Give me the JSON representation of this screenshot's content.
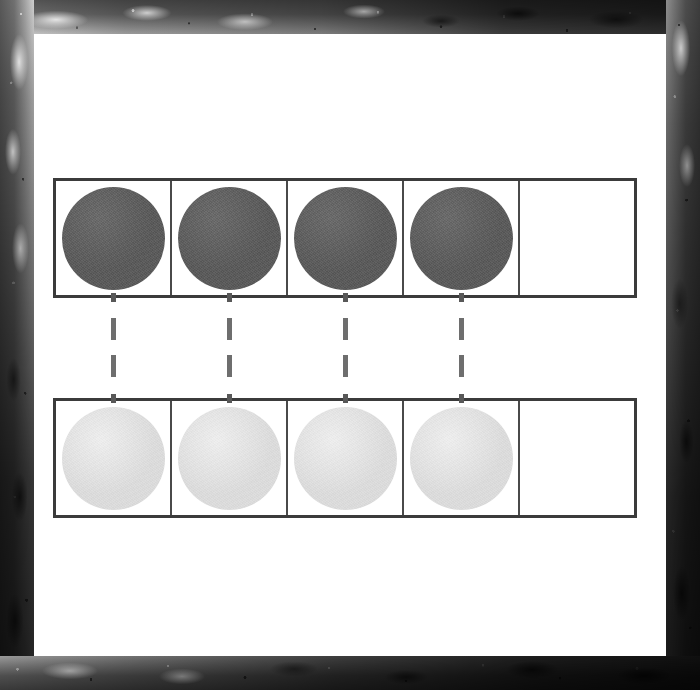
{
  "document": {
    "kind": "math-worksheet-scan",
    "title": "One-to-one correspondence ten-frame",
    "page_background": "#ffffff",
    "border_style": "grunge-photocopy-edge"
  },
  "palette": {
    "frame_stroke": "#3b3b3b",
    "cell_divider": "#4a4a4a",
    "dark_counter": "#5b5b5b",
    "light_counter": "#dedede",
    "connector": "#6e6e6e",
    "paper": "#ffffff",
    "border_dark": "#1a1a1a",
    "border_light": "#cfcfcf"
  },
  "rows": [
    {
      "id": "top-row",
      "name": "Top counter frame",
      "counter_style": "dark",
      "cell_count": 5,
      "filled_count": 4,
      "empty_count": 1,
      "cells": [
        {
          "index": 1,
          "filled": true,
          "counter": "dark"
        },
        {
          "index": 2,
          "filled": true,
          "counter": "dark"
        },
        {
          "index": 3,
          "filled": true,
          "counter": "dark"
        },
        {
          "index": 4,
          "filled": true,
          "counter": "dark"
        },
        {
          "index": 5,
          "filled": false,
          "counter": "none"
        }
      ]
    },
    {
      "id": "bottom-row",
      "name": "Bottom counter frame",
      "counter_style": "light",
      "cell_count": 5,
      "filled_count": 4,
      "empty_count": 1,
      "cells": [
        {
          "index": 1,
          "filled": true,
          "counter": "light"
        },
        {
          "index": 2,
          "filled": true,
          "counter": "light"
        },
        {
          "index": 3,
          "filled": true,
          "counter": "light"
        },
        {
          "index": 4,
          "filled": true,
          "counter": "light"
        },
        {
          "index": 5,
          "filled": false,
          "counter": "none"
        }
      ]
    }
  ],
  "connectors": {
    "name": "matching-dashed-lines",
    "count": 4,
    "style": "dashed-vertical",
    "segments_per_connector": 2,
    "left_positions_px": [
      111,
      227,
      343,
      459
    ]
  },
  "chart_data": {
    "type": "table",
    "categories": [
      "Cell 1",
      "Cell 2",
      "Cell 3",
      "Cell 4",
      "Cell 5"
    ],
    "series": [
      {
        "name": "Top row (dark counters)",
        "values": [
          1,
          1,
          1,
          1,
          0
        ]
      },
      {
        "name": "Bottom row (light counters)",
        "values": [
          1,
          1,
          1,
          1,
          0
        ]
      }
    ],
    "xlabel": "",
    "ylabel": "",
    "annotations": [
      "4 dark counters matched one-to-one with 4 light counters",
      "1 empty cell remains in each row"
    ],
    "legend_position": "none",
    "grid": false
  }
}
